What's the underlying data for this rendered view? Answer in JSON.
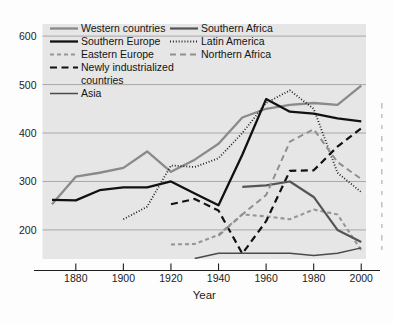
{
  "chart_data": {
    "type": "line",
    "title": "",
    "subtitle": "",
    "xlabel": "Year",
    "ylabel": "",
    "xlim": [
      1866,
      2002
    ],
    "ylim": [
      140,
      625
    ],
    "grid": true,
    "grid_axis": "y",
    "legend_position": "top-left-inside",
    "legend_columns": 2,
    "x_ticks": [
      1880,
      1900,
      1920,
      1940,
      1960,
      1980,
      2000
    ],
    "y_ticks": [
      200,
      300,
      400,
      500,
      600
    ],
    "plot_background": "#e6e6e6",
    "series": [
      {
        "name": "Western countries",
        "style": "solid",
        "color": "#8a8a8a",
        "width": 2.3,
        "x": [
          1870,
          1880,
          1890,
          1900,
          1910,
          1920,
          1930,
          1940,
          1950,
          1960,
          1970,
          1980,
          1990,
          2000
        ],
        "values": [
          253,
          310,
          318,
          328,
          362,
          320,
          345,
          378,
          432,
          450,
          458,
          462,
          458,
          498
        ]
      },
      {
        "name": "Southern Europe",
        "style": "solid",
        "color": "#111111",
        "width": 2.3,
        "x": [
          1870,
          1880,
          1890,
          1900,
          1910,
          1920,
          1930,
          1940,
          1950,
          1960,
          1970,
          1980,
          1990,
          2000
        ],
        "values": [
          262,
          261,
          282,
          288,
          288,
          300,
          275,
          251,
          355,
          470,
          444,
          440,
          430,
          424
        ]
      },
      {
        "name": "Eastern Europe",
        "style": "dashed-short",
        "color": "#969696",
        "width": 2.1,
        "x": [
          1920,
          1930,
          1940,
          1950,
          1960,
          1970,
          1980,
          1990,
          2000
        ],
        "values": [
          170,
          171,
          190,
          232,
          228,
          222,
          242,
          232,
          158
        ]
      },
      {
        "name": "Newly industrialized countries",
        "style": "dashed-long",
        "color": "#111111",
        "width": 2.2,
        "x": [
          1920,
          1930,
          1940,
          1950,
          1960,
          1970,
          1980,
          1990,
          2000
        ],
        "values": [
          253,
          264,
          240,
          151,
          218,
          322,
          323,
          372,
          410
        ]
      },
      {
        "name": "Asia",
        "style": "solid",
        "color": "#4a4a4a",
        "width": 1.5,
        "x": [
          1930,
          1940,
          1950,
          1960,
          1970,
          1980,
          1990,
          2000
        ],
        "values": [
          141,
          152,
          152,
          152,
          152,
          147,
          152,
          163
        ]
      },
      {
        "name": "Southern Africa",
        "style": "solid",
        "color": "#555555",
        "width": 2.2,
        "x": [
          1950,
          1960,
          1970,
          1980,
          1990,
          2000
        ],
        "values": [
          289,
          292,
          300,
          268,
          200,
          175
        ]
      },
      {
        "name": "Latin America",
        "style": "dotted",
        "color": "#111111",
        "width": 1.8,
        "x": [
          1900,
          1910,
          1920,
          1930,
          1940,
          1950,
          1960,
          1970,
          1980,
          1990,
          2000
        ],
        "values": [
          222,
          248,
          333,
          330,
          348,
          400,
          462,
          488,
          450,
          318,
          278
        ]
      },
      {
        "name": "Northern Africa",
        "style": "dashed-medium",
        "color": "#8f8f8f",
        "width": 2.0,
        "x": [
          1940,
          1950,
          1960,
          1970,
          1980,
          1990,
          2000
        ],
        "values": [
          188,
          232,
          272,
          382,
          408,
          340,
          305
        ]
      }
    ]
  },
  "legend": {
    "column_one": [
      {
        "label": "Western countries",
        "series": "Western countries"
      },
      {
        "label": "Southern Europe",
        "series": "Southern Europe"
      },
      {
        "label": "Eastern Europe",
        "series": "Eastern Europe"
      },
      {
        "label": "Newly industrialized",
        "series": "Newly industrialized countries"
      },
      {
        "label": "countries",
        "series": ""
      },
      {
        "label": "Asia",
        "series": "Asia"
      }
    ],
    "column_two": [
      {
        "label": "Southern Africa",
        "series": "Southern Africa"
      },
      {
        "label": "Latin America",
        "series": "Latin America"
      },
      {
        "label": "Northern Africa",
        "series": "Northern Africa"
      }
    ]
  },
  "axes": {
    "x_axis_title": "Year",
    "y_tick_labels": [
      "600",
      "500",
      "400",
      "300",
      "200"
    ],
    "x_tick_labels": [
      "1880",
      "1900",
      "1920",
      "1940",
      "1960",
      "1980",
      "2000"
    ]
  }
}
